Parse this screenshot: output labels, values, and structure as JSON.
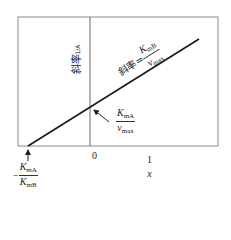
{
  "diagram": {
    "type": "lineweaver-burk-style plot",
    "x_axis": {
      "origin_label": "0",
      "label_num": "1",
      "label_den": "x"
    },
    "y_axis": {
      "label": "斜率 1/A",
      "label_prefix": "斜率",
      "label_suffix": "1/A"
    },
    "line": {
      "slope_prefix": "斜率=",
      "slope_num_main": "K",
      "slope_num_sub": "mB",
      "slope_den_main": "v",
      "slope_den_sub": "max"
    },
    "y_intercept": {
      "num_main": "K",
      "num_sub": "mA",
      "den_main": "v",
      "den_sub": "max"
    },
    "x_intercept": {
      "sign": "−",
      "num_main": "K",
      "num_sub": "mA",
      "den_main": "K",
      "den_sub": "mB"
    },
    "colors": {
      "frame": "#8a8a8a",
      "line": "#1a1a1a",
      "text": "#222222"
    }
  }
}
